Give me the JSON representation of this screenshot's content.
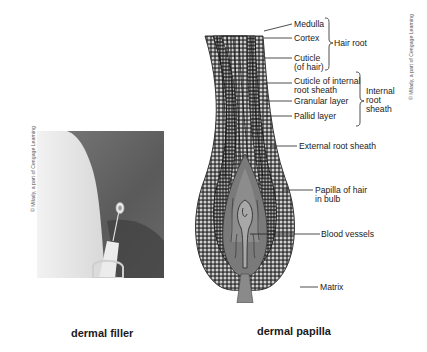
{
  "left_panel": {
    "caption": "dermal filler",
    "credit": "© Milady, a part of Cengage Learning"
  },
  "right_panel": {
    "caption": "dermal papilla",
    "credit": "© Milady, a part of Cengage Learning",
    "labels": {
      "medulla": "Medulla",
      "cortex": "Cortex",
      "cuticle_line1": "Cuticle",
      "cuticle_line2": "(of hair)",
      "hair_root": "Hair root",
      "cuticle_internal_line1": "Cuticle of internal",
      "cuticle_internal_line2": "root sheath",
      "granular": "Granular layer",
      "pallid": "Pallid layer",
      "internal_root_line1": "Internal",
      "internal_root_line2": "root",
      "internal_root_line3": "sheath",
      "external_root": "External root sheath",
      "papilla_line1": "Papilla of hair",
      "papilla_line2": "in bulb",
      "blood_vessels": "Blood vessels",
      "matrix": "Matrix"
    }
  },
  "colors": {
    "background": "#ffffff",
    "text": "#222222",
    "diagram_dark": "#4a4a4a",
    "diagram_mid": "#8a8a8a",
    "diagram_light": "#c8c8c8"
  }
}
